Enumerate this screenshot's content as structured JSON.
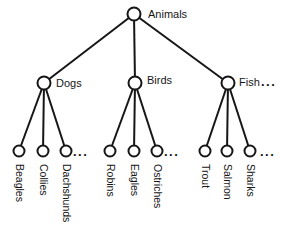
{
  "figure": {
    "background_color": "#ffffff",
    "line_color": "#161616",
    "tree": {
      "root": {
        "label": "Animals"
      },
      "branches": [
        {
          "label": "Dogs",
          "children": [
            "Beagles",
            "Collies",
            "Dachshunds"
          ],
          "ellipsis": "..."
        },
        {
          "label": "Birds",
          "children": [
            "Robins",
            "Eagles",
            "Ostriches"
          ],
          "ellipsis": "..."
        },
        {
          "label": "Fish",
          "label_suffix": "...",
          "children": [
            "Trout",
            "Salmon",
            "Sharks"
          ],
          "ellipsis": "..."
        }
      ]
    }
  }
}
